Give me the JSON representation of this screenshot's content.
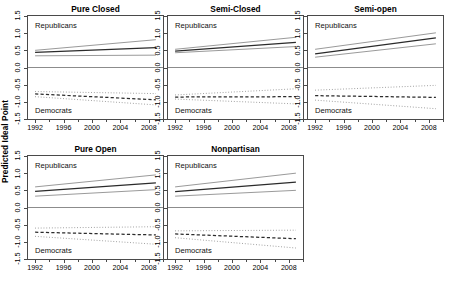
{
  "figure": {
    "ylabel": "Predicted Ideal Point",
    "group_labels": {
      "republicans": "Republicans",
      "democrats": "Democrats"
    }
  },
  "chart_data": {
    "type": "line",
    "title": "",
    "xlabel": "",
    "ylabel": "Predicted Ideal Point",
    "xlim": [
      1991,
      2010
    ],
    "ylim": [
      -1.5,
      1.5
    ],
    "yticks": [
      1.5,
      1.0,
      0.5,
      0.0,
      -0.5,
      -1.0,
      -1.5
    ],
    "ytick_labels": [
      "1.5",
      "1.0",
      "0.5",
      "0.0",
      "-0.5",
      "-1.0",
      "-1.5"
    ],
    "xticks": [
      1992,
      1996,
      2000,
      2004,
      2008
    ],
    "xtick_labels": [
      "1992",
      "1996",
      "2000",
      "2004",
      "2008"
    ],
    "x_minor_ticks": [
      1994,
      1998,
      2002,
      2006,
      2010
    ],
    "grid": false,
    "legend": "none",
    "reference_line": {
      "y": 0.0,
      "style": "solid",
      "color": "#8c8c8c"
    },
    "line_styles": {
      "republicans_fit": "solid",
      "republicans_bounds": "solid",
      "democrats_fit": "dashed",
      "democrats_bounds": "dotted"
    },
    "x": [
      1992,
      2009
    ],
    "panels": [
      {
        "name": "Pure Closed",
        "series": [
          {
            "name": "Republicans fit",
            "values": [
              0.44,
              0.58
            ]
          },
          {
            "name": "Republicans upper",
            "values": [
              0.5,
              0.81
            ]
          },
          {
            "name": "Republicans lower",
            "values": [
              0.34,
              0.36
            ]
          },
          {
            "name": "Democrats fit",
            "values": [
              -0.77,
              -0.94
            ]
          },
          {
            "name": "Democrats upper",
            "values": [
              -0.7,
              -0.76
            ]
          },
          {
            "name": "Democrats lower",
            "values": [
              -0.85,
              -1.09
            ]
          }
        ]
      },
      {
        "name": "Semi-Closed",
        "series": [
          {
            "name": "Republicans fit",
            "values": [
              0.48,
              0.73
            ]
          },
          {
            "name": "Republicans upper",
            "values": [
              0.53,
              0.88
            ]
          },
          {
            "name": "Republicans lower",
            "values": [
              0.43,
              0.61
            ]
          },
          {
            "name": "Democrats fit",
            "values": [
              -0.86,
              -0.85
            ]
          },
          {
            "name": "Democrats upper",
            "values": [
              -0.8,
              -0.62
            ]
          },
          {
            "name": "Democrats lower",
            "values": [
              -0.92,
              -1.06
            ]
          }
        ]
      },
      {
        "name": "Semi-open",
        "series": [
          {
            "name": "Republicans fit",
            "values": [
              0.4,
              0.86
            ]
          },
          {
            "name": "Republicans upper",
            "values": [
              0.53,
              1.01
            ]
          },
          {
            "name": "Republicans lower",
            "values": [
              0.3,
              0.69
            ]
          },
          {
            "name": "Democrats fit",
            "values": [
              -0.82,
              -0.87
            ]
          },
          {
            "name": "Democrats upper",
            "values": [
              -0.66,
              -0.52
            ]
          },
          {
            "name": "Democrats lower",
            "values": [
              -0.95,
              -1.2
            ]
          }
        ]
      },
      {
        "name": "Pure Open",
        "series": [
          {
            "name": "Republicans fit",
            "values": [
              0.47,
              0.72
            ]
          },
          {
            "name": "Republicans upper",
            "values": [
              0.6,
              0.95
            ]
          },
          {
            "name": "Republicans lower",
            "values": [
              0.33,
              0.52
            ]
          },
          {
            "name": "Democrats fit",
            "values": [
              -0.72,
              -0.8
            ]
          },
          {
            "name": "Democrats upper",
            "values": [
              -0.6,
              -0.56
            ]
          },
          {
            "name": "Democrats lower",
            "values": [
              -0.84,
              -1.07
            ]
          }
        ]
      },
      {
        "name": "Nonpartisan",
        "series": [
          {
            "name": "Republicans fit",
            "values": [
              0.46,
              0.74
            ]
          },
          {
            "name": "Republicans upper",
            "values": [
              0.6,
              1.0
            ]
          },
          {
            "name": "Republicans lower",
            "values": [
              0.33,
              0.5
            ]
          },
          {
            "name": "Democrats fit",
            "values": [
              -0.77,
              -0.91
            ]
          },
          {
            "name": "Democrats upper",
            "values": [
              -0.68,
              -0.66
            ]
          },
          {
            "name": "Democrats lower",
            "values": [
              -0.88,
              -1.18
            ]
          }
        ]
      }
    ]
  }
}
